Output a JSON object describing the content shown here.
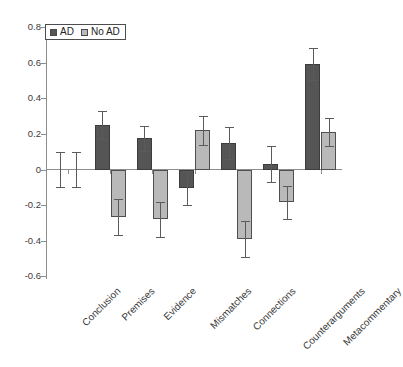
{
  "chart_data": {
    "type": "bar",
    "title": "",
    "xlabel": "",
    "ylabel": "",
    "ylim": [
      -0.6,
      0.8
    ],
    "ytick_labels": [
      "0.8",
      "0.6",
      "0.4",
      "0.2",
      "0",
      "-0.2",
      "-0.4",
      "-0.6"
    ],
    "ytick_values": [
      0.8,
      0.6,
      0.4,
      0.2,
      0,
      -0.2,
      -0.4,
      -0.6
    ],
    "grid": false,
    "legend_position": "top-left",
    "categories": [
      "Conclusion",
      "Premises",
      "Evidence",
      "Mismatches",
      "Connections",
      "Counterarguments",
      "Metacommentary"
    ],
    "series": [
      {
        "name": "AD",
        "color": "#555555",
        "values": [
          0.0,
          0.25,
          0.175,
          -0.105,
          0.15,
          0.03,
          0.59
        ],
        "errors": [
          0.1,
          0.08,
          0.07,
          0.095,
          0.09,
          0.1,
          0.09
        ]
      },
      {
        "name": "No AD",
        "color": "#b9b9b9",
        "values": [
          0.0,
          -0.265,
          -0.28,
          0.22,
          -0.39,
          -0.185,
          0.21
        ],
        "errors": [
          0.1,
          0.1,
          0.1,
          0.08,
          0.1,
          0.095,
          0.08
        ]
      }
    ]
  },
  "legend": {
    "entries": [
      {
        "label": "AD"
      },
      {
        "label": "No AD"
      }
    ]
  },
  "axis": {
    "zero_label": "0"
  }
}
